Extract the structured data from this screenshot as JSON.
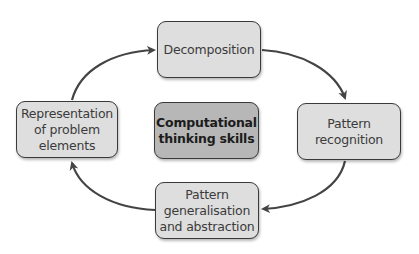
{
  "diagram": {
    "type": "cycle",
    "center": {
      "label": "Computational\nthinking skills"
    },
    "nodes": [
      {
        "id": "decomposition",
        "label": "Decomposition"
      },
      {
        "id": "pattern-recognition",
        "label": "Pattern\nrecognition"
      },
      {
        "id": "pattern-generalisation",
        "label": "Pattern\ngeneralisation\nand abstraction"
      },
      {
        "id": "representation",
        "label": "Representation\nof problem\nelements"
      }
    ],
    "edges": [
      {
        "from": "decomposition",
        "to": "pattern-recognition"
      },
      {
        "from": "pattern-recognition",
        "to": "pattern-generalisation"
      },
      {
        "from": "pattern-generalisation",
        "to": "representation"
      },
      {
        "from": "representation",
        "to": "decomposition"
      }
    ],
    "colors": {
      "node_fill": "#dedede",
      "center_fill": "#b7b7b7",
      "border": "#3a3a3a",
      "arrow": "#444444",
      "background": "#ffffff"
    }
  }
}
